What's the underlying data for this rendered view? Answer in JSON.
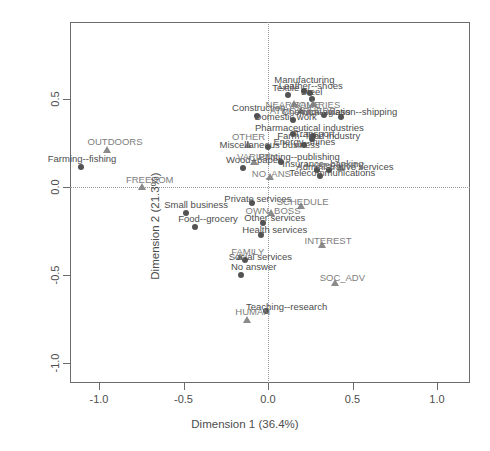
{
  "chart_data": {
    "type": "scatter",
    "title": "",
    "xlabel": "Dimension 1 (36.4%)",
    "ylabel": "Dimension 2 (21.3%)",
    "xlim": [
      -1.2,
      1.2
    ],
    "ylim": [
      -1.3,
      0.85
    ],
    "xticks": [
      "-1.0",
      "-0.5",
      "0.0",
      "0.5",
      "1.0"
    ],
    "xtick_values": [
      -1.0,
      -0.5,
      0.0,
      0.5,
      1.0
    ],
    "yticks": [
      "0.5",
      "0.0",
      "-0.5",
      "-1.0"
    ],
    "ytick_values": [
      0.5,
      0.0,
      -0.5,
      -1.0
    ],
    "grid": false,
    "reference_lines": {
      "x": 0.0,
      "y": 0.0,
      "style": "dotted"
    },
    "legend": "none",
    "series": [
      {
        "name": "Activity sector (circle)",
        "marker": "circle",
        "color": "#535353",
        "points": [
          {
            "label": "Farming--fishing",
            "x": -1.105,
            "y": 0.115,
            "lx": -1.1,
            "ly": 0.16,
            "anchor": "center"
          },
          {
            "label": "Small business",
            "x": -0.485,
            "y": -0.145,
            "lx": -0.425,
            "ly": -0.105,
            "anchor": "center"
          },
          {
            "label": "Food--grocery",
            "x": -0.43,
            "y": -0.225,
            "lx": -0.355,
            "ly": -0.18,
            "anchor": "center"
          },
          {
            "label": "Textile",
            "x": 0.118,
            "y": 0.52,
            "lx": 0.105,
            "ly": 0.565,
            "anchor": "center"
          },
          {
            "label": "Manufacturing",
            "x": 0.215,
            "y": 0.545,
            "lx": 0.215,
            "ly": 0.61,
            "anchor": "center"
          },
          {
            "label": "Leather--shoes",
            "x": 0.248,
            "y": 0.535,
            "lx": 0.253,
            "ly": 0.573,
            "anchor": "center"
          },
          {
            "label": "Steel",
            "x": 0.258,
            "y": 0.5,
            "lx": 0.258,
            "ly": 0.538,
            "anchor": "center"
          },
          {
            "label": "Construction",
            "x": -0.068,
            "y": 0.405,
            "lx": -0.055,
            "ly": 0.448,
            "anchor": "center"
          },
          {
            "label": "Chemical--glass",
            "x": 0.33,
            "y": 0.41,
            "lx": 0.285,
            "ly": 0.425,
            "anchor": "center"
          },
          {
            "label": "Auto--aviation--shipping",
            "x": 0.43,
            "y": 0.4,
            "lx": 0.468,
            "ly": 0.428,
            "anchor": "center"
          },
          {
            "label": "Domestic work",
            "x": 0.145,
            "y": 0.382,
            "lx": 0.105,
            "ly": 0.397,
            "anchor": "center"
          },
          {
            "label": "Pharmaceutical industries",
            "x": 0.145,
            "y": 0.3,
            "lx": 0.245,
            "ly": 0.335,
            "anchor": "center"
          },
          {
            "label": "Transport",
            "x": 0.268,
            "y": 0.288,
            "lx": 0.275,
            "ly": 0.3,
            "anchor": "center"
          },
          {
            "label": "Farm--food industry",
            "x": 0.262,
            "y": 0.272,
            "lx": 0.3,
            "ly": 0.288,
            "anchor": "center"
          },
          {
            "label": "Energy--mines",
            "x": 0.213,
            "y": 0.238,
            "lx": 0.215,
            "ly": 0.253,
            "anchor": "center"
          },
          {
            "label": "Miscellaneous business",
            "x": 0.0,
            "y": 0.225,
            "lx": 0.01,
            "ly": 0.24,
            "anchor": "center"
          },
          {
            "label": "Wood--paper",
            "x": -0.15,
            "y": 0.11,
            "lx": -0.085,
            "ly": 0.155,
            "anchor": "center"
          },
          {
            "label": "Printing--publishing",
            "x": 0.075,
            "y": 0.14,
            "lx": 0.185,
            "ly": 0.172,
            "anchor": "center"
          },
          {
            "label": "Insurance--banking",
            "x": 0.29,
            "y": 0.095,
            "lx": 0.325,
            "ly": 0.128,
            "anchor": "center"
          },
          {
            "label": "Administrative services",
            "x": 0.36,
            "y": 0.098,
            "lx": 0.455,
            "ly": 0.112,
            "anchor": "center"
          },
          {
            "label": "Telecommunications",
            "x": 0.31,
            "y": 0.062,
            "lx": 0.38,
            "ly": 0.08,
            "anchor": "center"
          },
          {
            "label": "Private services",
            "x": -0.095,
            "y": -0.092,
            "lx": -0.06,
            "ly": -0.07,
            "anchor": "center"
          },
          {
            "label": "Other services",
            "x": -0.03,
            "y": -0.205,
            "lx": 0.04,
            "ly": -0.175,
            "anchor": "center"
          },
          {
            "label": "Health services",
            "x": -0.04,
            "y": -0.275,
            "lx": 0.04,
            "ly": -0.245,
            "anchor": "center"
          },
          {
            "label": "Social services",
            "x": -0.135,
            "y": -0.415,
            "lx": -0.045,
            "ly": -0.395,
            "anchor": "center"
          },
          {
            "label": "No answer",
            "x": -0.16,
            "y": -0.5,
            "lx": -0.085,
            "ly": -0.455,
            "anchor": "center"
          },
          {
            "label": "Teaching--research",
            "x": -0.01,
            "y": -0.705,
            "lx": 0.11,
            "ly": -0.68,
            "anchor": "center"
          }
        ]
      },
      {
        "name": "Job criterion (triangle)",
        "marker": "triangle",
        "color": "#8a8a8a",
        "points": [
          {
            "label": "OUTDOORS",
            "x": -0.955,
            "y": 0.21,
            "lx": -0.905,
            "ly": 0.258,
            "anchor": "center"
          },
          {
            "label": "FREEDOM",
            "x": -0.745,
            "y": 0.0,
            "lx": -0.7,
            "ly": 0.042,
            "anchor": "center"
          },
          {
            "label": "OTHER",
            "x": -0.12,
            "y": 0.238,
            "lx": -0.115,
            "ly": 0.282,
            "anchor": "center"
          },
          {
            "label": "NEARHOME",
            "x": 0.155,
            "y": 0.47,
            "lx": 0.148,
            "ly": 0.468,
            "anchor": "center"
          },
          {
            "label": "SALARIES",
            "x": 0.268,
            "y": 0.47,
            "lx": 0.29,
            "ly": 0.468,
            "anchor": "center"
          },
          {
            "label": "ATMOSPHERE",
            "x": 0.198,
            "y": 0.432,
            "lx": 0.205,
            "ly": 0.432,
            "anchor": "center"
          },
          {
            "label": "VARIETY",
            "x": -0.085,
            "y": 0.142,
            "lx": -0.065,
            "ly": 0.17,
            "anchor": "center"
          },
          {
            "label": "NO_ANS",
            "x": 0.01,
            "y": 0.058,
            "lx": 0.02,
            "ly": 0.072,
            "anchor": "center"
          },
          {
            "label": "SECURITY",
            "x": 0.43,
            "y": 0.108,
            "lx": 0.43,
            "ly": 0.122,
            "anchor": "center"
          },
          {
            "label": "SCHEDULE",
            "x": 0.195,
            "y": -0.108,
            "lx": 0.205,
            "ly": -0.085,
            "anchor": "center"
          },
          {
            "label": "OWN_BOSS",
            "x": 0.02,
            "y": -0.148,
            "lx": 0.03,
            "ly": -0.138,
            "anchor": "center"
          },
          {
            "label": "INTEREST",
            "x": 0.32,
            "y": -0.33,
            "lx": 0.355,
            "ly": -0.305,
            "anchor": "center"
          },
          {
            "label": "FAMILY",
            "x": -0.165,
            "y": -0.398,
            "lx": -0.12,
            "ly": -0.368,
            "anchor": "center"
          },
          {
            "label": "SOC_ADV",
            "x": 0.395,
            "y": -0.545,
            "lx": 0.44,
            "ly": -0.515,
            "anchor": "center"
          },
          {
            "label": "HUMAN",
            "x": -0.125,
            "y": -0.758,
            "lx": -0.09,
            "ly": -0.712,
            "anchor": "center"
          }
        ]
      }
    ]
  }
}
